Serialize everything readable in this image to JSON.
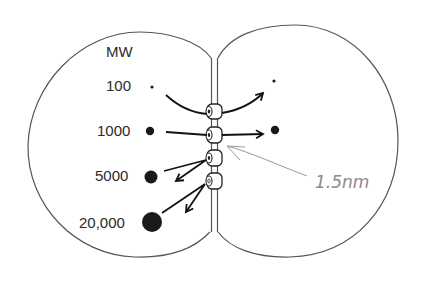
{
  "diagram": {
    "title_label": "MW",
    "molecules": [
      {
        "mw_label": "100",
        "size": "tiny",
        "passes": true
      },
      {
        "mw_label": "1000",
        "size": "small",
        "passes": true
      },
      {
        "mw_label": "5000",
        "size": "medium",
        "passes": false
      },
      {
        "mw_label": "20,000",
        "size": "large",
        "passes": false
      }
    ],
    "annotation": "1.5nm",
    "cells": [
      "left-cell",
      "right-cell"
    ],
    "channels_count": 4,
    "colors": {
      "outline": "#555555",
      "molecule": "#1a1a1a",
      "arrow": "#111111",
      "annotation": "#8a8a8a"
    }
  }
}
